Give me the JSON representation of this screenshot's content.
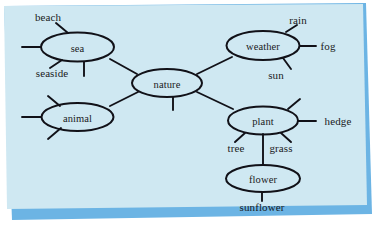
{
  "figure": {
    "kind": "semantic-network-diagram",
    "background_color": "#cfe8f2",
    "edge_color": "#111118",
    "text_color": "#1a1a22",
    "border_strip_color": "#6cb4e4"
  },
  "nodes": [
    {
      "id": "sea",
      "label": "sea",
      "cx": 77.5,
      "cy": 47.0,
      "rx": 36.5,
      "ry": 14.5
    },
    {
      "id": "nature",
      "label": "nature",
      "cx": 167.0,
      "cy": 83.0,
      "rx": 35.0,
      "ry": 14.0
    },
    {
      "id": "weather",
      "label": "weather",
      "cx": 263.0,
      "cy": 45.5,
      "rx": 36.5,
      "ry": 14.5
    },
    {
      "id": "animal",
      "label": "animal",
      "cx": 77.5,
      "cy": 117.0,
      "rx": 36.0,
      "ry": 14.0
    },
    {
      "id": "plant",
      "label": "plant",
      "cx": 263.0,
      "cy": 120.5,
      "rx": 35.0,
      "ry": 14.0
    },
    {
      "id": "flower",
      "label": "flower",
      "cx": 263.0,
      "cy": 178.5,
      "rx": 37.0,
      "ry": 13.5
    }
  ],
  "leaves": [
    {
      "id": "beach",
      "label": "beach",
      "x": 48,
      "y": 17
    },
    {
      "id": "seaside",
      "label": "seaside",
      "x": 52,
      "y": 73
    },
    {
      "id": "rain",
      "label": "rain",
      "x": 298,
      "y": 20
    },
    {
      "id": "fog",
      "label": "fog",
      "x": 328,
      "y": 46
    },
    {
      "id": "sun",
      "label": "sun",
      "x": 276,
      "y": 75
    },
    {
      "id": "hedge",
      "label": "hedge",
      "x": 338,
      "y": 121
    },
    {
      "id": "tree",
      "label": "tree",
      "x": 236,
      "y": 148
    },
    {
      "id": "grass",
      "label": "grass",
      "x": 281,
      "y": 148
    },
    {
      "id": "sunflower",
      "label": "sunflower",
      "x": 262,
      "y": 207
    }
  ],
  "edges": [
    {
      "id": "sea-nature",
      "from": "sea",
      "to": "nature",
      "x1": 110,
      "y1": 59,
      "x2": 137,
      "y2": 74
    },
    {
      "id": "nature-weather",
      "from": "nature",
      "to": "weather",
      "x1": 197,
      "y1": 74,
      "x2": 232,
      "y2": 57
    },
    {
      "id": "animal-nature",
      "from": "animal",
      "to": "nature",
      "x1": 110,
      "y1": 106,
      "x2": 138,
      "y2": 92
    },
    {
      "id": "nature-plant",
      "from": "nature",
      "to": "plant",
      "x1": 197,
      "y1": 92,
      "x2": 233,
      "y2": 109
    },
    {
      "id": "plant-flower",
      "from": "plant",
      "to": "flower",
      "x1": 263,
      "y1": 134,
      "x2": 263,
      "y2": 165
    }
  ],
  "stubs": [
    {
      "id": "sea-beach",
      "node": "sea",
      "leaf": "beach",
      "x1": 68,
      "y1": 33,
      "x2": 56,
      "y2": 23
    },
    {
      "id": "sea-left",
      "node": "sea",
      "leaf": null,
      "x1": 41,
      "y1": 47,
      "x2": 22,
      "y2": 47
    },
    {
      "id": "sea-seaside",
      "node": "sea",
      "leaf": "seaside",
      "x1": 62,
      "y1": 60,
      "x2": 50,
      "y2": 68
    },
    {
      "id": "sea-down",
      "node": "sea",
      "leaf": null,
      "x1": 84,
      "y1": 62,
      "x2": 84,
      "y2": 76
    },
    {
      "id": "nature-down",
      "node": "nature",
      "leaf": null,
      "x1": 173,
      "y1": 97,
      "x2": 173,
      "y2": 110
    },
    {
      "id": "weather-rain",
      "node": "weather",
      "leaf": "rain",
      "x1": 286,
      "y1": 32,
      "x2": 297,
      "y2": 25
    },
    {
      "id": "weather-fog",
      "node": "weather",
      "leaf": "fog",
      "x1": 300,
      "y1": 46,
      "x2": 316,
      "y2": 46
    },
    {
      "id": "weather-sun",
      "node": "weather",
      "leaf": "sun",
      "x1": 283,
      "y1": 58,
      "x2": 291,
      "y2": 69
    },
    {
      "id": "animal-left",
      "node": "animal",
      "leaf": null,
      "x1": 41,
      "y1": 117,
      "x2": 22,
      "y2": 117
    },
    {
      "id": "animal-up",
      "node": "animal",
      "leaf": null,
      "x1": 60,
      "y1": 106,
      "x2": 48,
      "y2": 96
    },
    {
      "id": "animal-down",
      "node": "animal",
      "leaf": null,
      "x1": 61,
      "y1": 128,
      "x2": 48,
      "y2": 139
    },
    {
      "id": "plant-up",
      "node": "plant",
      "leaf": null,
      "x1": 288,
      "y1": 109,
      "x2": 300,
      "y2": 99
    },
    {
      "id": "plant-hedge",
      "node": "plant",
      "leaf": "hedge",
      "x1": 298,
      "y1": 121,
      "x2": 316,
      "y2": 121
    },
    {
      "id": "plant-tree",
      "node": "plant",
      "leaf": "tree",
      "x1": 245,
      "y1": 133,
      "x2": 235,
      "y2": 142
    },
    {
      "id": "plant-grass",
      "node": "plant",
      "leaf": "grass",
      "x1": 281,
      "y1": 133,
      "x2": 291,
      "y2": 142
    },
    {
      "id": "flower-sunflower",
      "node": "flower",
      "leaf": "sunflower",
      "x1": 262,
      "y1": 192,
      "x2": 262,
      "y2": 201
    }
  ]
}
